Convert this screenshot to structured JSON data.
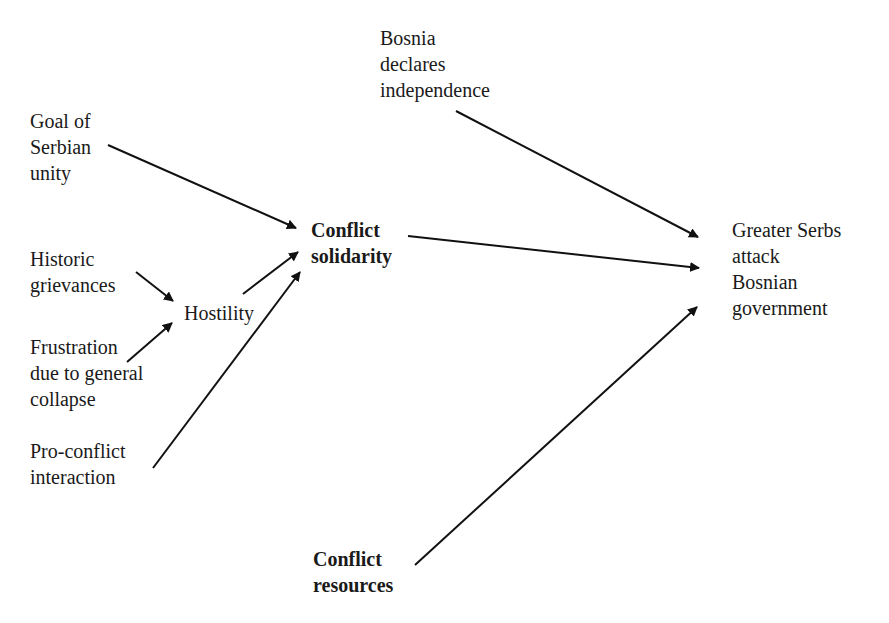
{
  "diagram": {
    "type": "causal-flow",
    "nodes": {
      "bosnia_declares": {
        "label": "Bosnia\ndeclares\nindependence",
        "bold": false
      },
      "goal_serbian_unity": {
        "label": "Goal of\nSerbian\nunity",
        "bold": false
      },
      "historic_grievances": {
        "label": "Historic\ngrievances",
        "bold": false
      },
      "hostility": {
        "label": "Hostility",
        "bold": false
      },
      "frustration": {
        "label": "Frustration\ndue to general\ncollapse",
        "bold": false
      },
      "pro_conflict": {
        "label": "Pro-conflict\ninteraction",
        "bold": false
      },
      "conflict_solidarity": {
        "label": "Conflict\nsolidarity",
        "bold": true
      },
      "conflict_resources": {
        "label": "Conflict\nresources",
        "bold": true
      },
      "greater_serbs_attack": {
        "label": "Greater Serbs\nattack\nBosnian\ngovernment",
        "bold": false
      }
    },
    "edges": [
      {
        "from": "goal_serbian_unity",
        "to": "conflict_solidarity"
      },
      {
        "from": "historic_grievances",
        "to": "hostility"
      },
      {
        "from": "frustration",
        "to": "hostility"
      },
      {
        "from": "hostility",
        "to": "conflict_solidarity"
      },
      {
        "from": "pro_conflict",
        "to": "conflict_solidarity"
      },
      {
        "from": "bosnia_declares",
        "to": "greater_serbs_attack"
      },
      {
        "from": "conflict_solidarity",
        "to": "greater_serbs_attack"
      },
      {
        "from": "conflict_resources",
        "to": "greater_serbs_attack"
      }
    ],
    "colors": {
      "line": "#111111",
      "text": "#1a1a1a",
      "background": "#ffffff"
    }
  }
}
